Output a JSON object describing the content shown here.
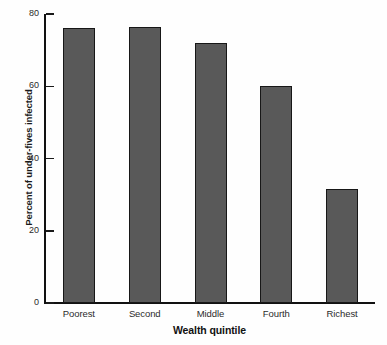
{
  "chart_data": {
    "type": "bar",
    "title": "",
    "subtitle": "",
    "categories": [
      "Poorest",
      "Second",
      "Middle",
      "Fourth",
      "Richest"
    ],
    "values": [
      76,
      76.5,
      72,
      60,
      31.5
    ],
    "xlabel": "Wealth quintile",
    "ylabel": "Percent of under-fives infected",
    "ylim": [
      0,
      80
    ],
    "yticks": [
      0,
      20,
      40,
      60,
      80
    ],
    "ytick_labels": [
      "0",
      "20",
      "40",
      "60",
      "80"
    ],
    "grid": false,
    "legend": false,
    "bar_color": "#595959",
    "bar_edge_color": "#171717",
    "axis_color": "#111111",
    "background_color": "#fefefe"
  }
}
